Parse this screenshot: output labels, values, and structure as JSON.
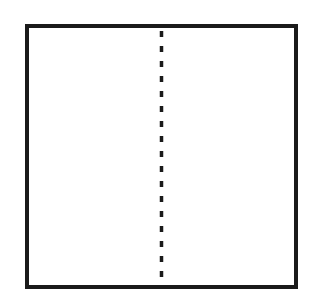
{
  "diagram": {
    "type": "square-divided-in-half",
    "shape": "square",
    "divider": "dashed-vertical-line",
    "colors": {
      "background": "#ffffff",
      "stroke": "#1a1a1a"
    },
    "square": {
      "x": 27,
      "y": 26,
      "width": 269,
      "height": 261,
      "stroke_width": 4
    },
    "divider_line": {
      "x": 161.5,
      "y1": 28,
      "y2": 285,
      "stroke_width": 3.5,
      "dash": "6 9"
    }
  }
}
